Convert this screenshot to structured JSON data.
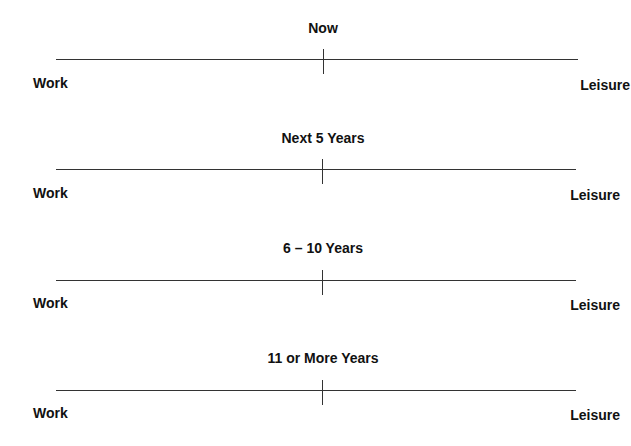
{
  "scales": [
    {
      "title": "Now",
      "left_label": "Work",
      "right_label": "Leisure"
    },
    {
      "title": "Next 5 Years",
      "left_label": "Work",
      "right_label": "Leisure"
    },
    {
      "title": "6 – 10 Years",
      "left_label": "Work",
      "right_label": "Leisure"
    },
    {
      "title": "11 or More Years",
      "left_label": "Work",
      "right_label": "Leisure"
    }
  ]
}
